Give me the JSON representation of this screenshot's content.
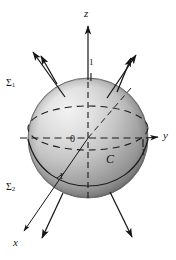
{
  "figure": {
    "background_color": "#ffffff",
    "ink_color": "#161616",
    "sphere": {
      "center_x": 88,
      "center_y": 138,
      "radius": 60,
      "fill_light": "#efefef",
      "fill_mid": "#b9b9b9",
      "fill_dark": "#7d7d7d",
      "edge_color": "#5d5d5d"
    },
    "axes": [
      {
        "name": "z-axis",
        "label": "z",
        "label_x": 84,
        "label_y": 15,
        "direction": "up"
      },
      {
        "name": "y-axis",
        "label": "y",
        "label_x": 163,
        "label_y": 136,
        "direction": "right"
      },
      {
        "name": "x-axis",
        "label": "x",
        "label_x": 13,
        "label_y": 243,
        "direction": "down-left"
      }
    ],
    "ticks": [
      {
        "name": "z-unit-tick",
        "label": "1",
        "x": 91,
        "y": 67
      },
      {
        "name": "y-unit-tick",
        "label": "1",
        "x": 143,
        "y": 153
      },
      {
        "name": "x-unit-tick",
        "label": "1",
        "x": 60,
        "y": 176
      }
    ],
    "origin": {
      "label": "0",
      "x": 71,
      "y": 141
    },
    "curve": {
      "name": "boundary-curve",
      "label": "C",
      "x": 108,
      "y": 160
    },
    "surfaces": [
      {
        "name": "upper-hemisphere",
        "symbol": "Σ",
        "subscript": "1",
        "x": 6,
        "y": 84
      },
      {
        "name": "lower-hemisphere",
        "symbol": "Σ",
        "subscript": "2",
        "x": 6,
        "y": 188
      }
    ],
    "normal_vectors": [
      {
        "name": "normal-arrow-upper-left",
        "x1": 65,
        "y1": 97,
        "x2": 33,
        "y2": 52
      },
      {
        "name": "normal-arrow-upper-left-outer",
        "x1": 57,
        "y1": 84,
        "x2": 41,
        "y2": 56
      },
      {
        "name": "normal-arrow-upper-right",
        "x1": 107,
        "y1": 98,
        "x2": 136,
        "y2": 55
      },
      {
        "name": "normal-arrow-upper-right-outer",
        "x1": 117,
        "y1": 92,
        "x2": 131,
        "y2": 58
      },
      {
        "name": "normal-arrow-lower-left",
        "x1": 63,
        "y1": 193,
        "x2": 42,
        "y2": 238
      },
      {
        "name": "normal-arrow-lower-right",
        "x1": 110,
        "y1": 192,
        "x2": 132,
        "y2": 237
      },
      {
        "name": "normal-arrow-lower-far-left",
        "x1": 52,
        "y1": 186,
        "x2": 17,
        "y2": 235
      }
    ]
  }
}
